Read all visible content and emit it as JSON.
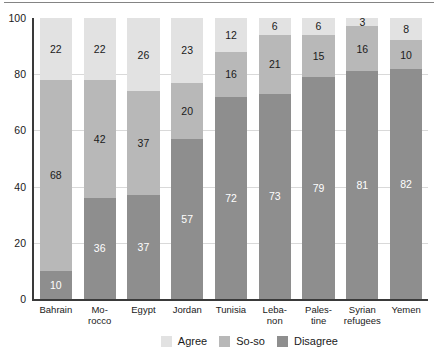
{
  "chart_data": {
    "type": "bar",
    "subtype": "stacked-bar-100",
    "title": "",
    "subtitle": "",
    "xlabel": "",
    "ylabel": "",
    "ylim": [
      0,
      100
    ],
    "yticks": [
      0,
      20,
      40,
      60,
      80,
      100
    ],
    "ytick_labels": [
      "0",
      "20",
      "40",
      "60",
      "80",
      "100"
    ],
    "grid": "horizontal",
    "legend_position": "bottom-right",
    "categories": [
      "Bahrain",
      "Morocco",
      "Egypt",
      "Jordan",
      "Tunisia",
      "Lebanon",
      "Palestine",
      "Syrian refugees",
      "Yemen"
    ],
    "category_lines": [
      [
        "Bahrain"
      ],
      [
        "Mo-",
        "rocco"
      ],
      [
        "Egypt"
      ],
      [
        "Jordan"
      ],
      [
        "Tunisia"
      ],
      [
        "Leba-",
        "non"
      ],
      [
        "Pales-",
        "tine"
      ],
      [
        "Syrian",
        "refugees"
      ],
      [
        "Yemen"
      ]
    ],
    "series": [
      {
        "name": "Disagree",
        "color": "#8e8e8e",
        "values": [
          10,
          36,
          37,
          57,
          72,
          73,
          79,
          81,
          82
        ]
      },
      {
        "name": "So-so",
        "color": "#b8b8b8",
        "values": [
          68,
          42,
          37,
          20,
          16,
          21,
          15,
          16,
          10
        ]
      },
      {
        "name": "Agree",
        "color": "#e2e2e2",
        "values": [
          22,
          22,
          26,
          23,
          12,
          6,
          6,
          3,
          8
        ]
      }
    ],
    "legend": [
      {
        "label": "Agree",
        "color": "#e2e2e2"
      },
      {
        "label": "So-so",
        "color": "#b8b8b8"
      },
      {
        "label": "Disagree",
        "color": "#8e8e8e"
      }
    ]
  },
  "colors": {
    "agree": "#e2e2e2",
    "soso": "#b8b8b8",
    "disagree": "#8e8e8e",
    "axis": "#3a3a3a",
    "grid": "#d9d9d9",
    "text": "#1a1a1a",
    "background": "#ffffff"
  }
}
